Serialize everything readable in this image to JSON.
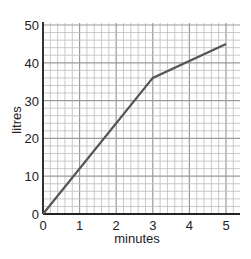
{
  "chart_data": {
    "type": "line",
    "title": "",
    "xlabel": "minutes",
    "ylabel": "litres",
    "xlim": [
      0,
      5
    ],
    "ylim": [
      0,
      50
    ],
    "x_ticks": [
      "0",
      "1",
      "2",
      "3",
      "4",
      "5"
    ],
    "y_ticks": [
      "0",
      "10",
      "20",
      "30",
      "40",
      "50"
    ],
    "grid": true,
    "minor_grid_step": {
      "x": 0.2,
      "y": 2
    },
    "legend": null,
    "series": [
      {
        "name": "litres",
        "x": [
          0,
          3,
          5
        ],
        "y": [
          0,
          36,
          45
        ],
        "color": "#555555"
      }
    ]
  },
  "colors": {
    "grid_minor": "#bdbdbd",
    "grid_major": "#9a9a9a",
    "axis": "#222222",
    "line": "#555555"
  }
}
